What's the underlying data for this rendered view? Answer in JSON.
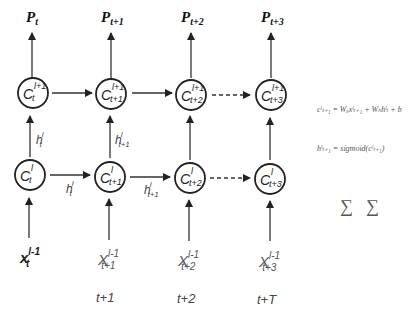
{
  "diagram": {
    "type": "unrolled recurrent network (two layers)",
    "output_labels": [
      {
        "base": "P",
        "sub": "t"
      },
      {
        "base": "P",
        "sub": "t+1"
      },
      {
        "base": "P",
        "sub": "t+2"
      },
      {
        "base": "P",
        "sub": "t+3"
      }
    ],
    "top_nodes": [
      {
        "base": "C",
        "sup": "l+1",
        "sub": "t"
      },
      {
        "base": "C",
        "sup": "l+1",
        "sub": "t+1"
      },
      {
        "base": "C",
        "sup": "l+1",
        "sub": "t+2"
      },
      {
        "base": "C",
        "sup": "l+1",
        "sub": "t+3"
      }
    ],
    "bottom_nodes": [
      {
        "base": "C",
        "sup": "l",
        "sub": "t"
      },
      {
        "base": "C",
        "sup": "l",
        "sub": "t+1"
      },
      {
        "base": "C",
        "sup": "l",
        "sub": "t+2"
      },
      {
        "base": "C",
        "sup": "l",
        "sub": "t+3"
      }
    ],
    "vertical_h_labels": [
      {
        "base": "h",
        "sup": "l",
        "sub": "t"
      },
      {
        "base": "h",
        "sup": "l",
        "sub": "t+1"
      }
    ],
    "horizontal_h_labels": [
      {
        "base": "h",
        "sup": "l",
        "sub": "t"
      },
      {
        "base": "h",
        "sup": "l",
        "sub": "t+1"
      }
    ],
    "input_labels": [
      {
        "base": "x",
        "sup": "l-1",
        "sub": "t"
      },
      {
        "base": "X",
        "sup": "l-1",
        "sub": "t+1"
      },
      {
        "base": "X",
        "sup": "l-1",
        "sub": "t+2"
      },
      {
        "base": "X",
        "sup": "l-1",
        "sub": "t+3"
      }
    ],
    "time_labels": [
      "",
      "t+1",
      "t+2",
      "t+T"
    ],
    "equations": [
      "cˡₜ₊₁ = Wₓxˡₜ₊₁ + Wₕhˡₜ + b",
      "hˡₜ₊₁ = sigmoid(cˡₜ₊₁)",
      "L = ∑ⱼ₌₁ᵀ Lⱼ = ∑ⱼ₌₁ᵀ (yⱼ − pⱼ)²"
    ],
    "arrow_color": "#333333",
    "node_stroke": "#222222"
  }
}
